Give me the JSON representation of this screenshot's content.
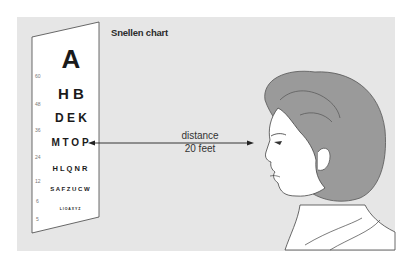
{
  "title": "Snellen chart",
  "distance": {
    "label_line1": "distance",
    "label_line2": "20 feet"
  },
  "chart": {
    "rows": [
      {
        "size_label": "60",
        "letters": "A"
      },
      {
        "size_label": "48",
        "letters": "H B"
      },
      {
        "size_label": "36",
        "letters": "D E K"
      },
      {
        "size_label": "24",
        "letters": "M T O P"
      },
      {
        "size_label": "12",
        "letters": "H L Q N R"
      },
      {
        "size_label": "6",
        "letters": "S A F Z U C W"
      },
      {
        "size_label": "5",
        "letters": "L I O A X Y Z"
      }
    ]
  },
  "colors": {
    "panel_bg": "#e6e6e6",
    "hair": "#9a9a9a",
    "skin": "#ffffff",
    "line": "#333333"
  }
}
